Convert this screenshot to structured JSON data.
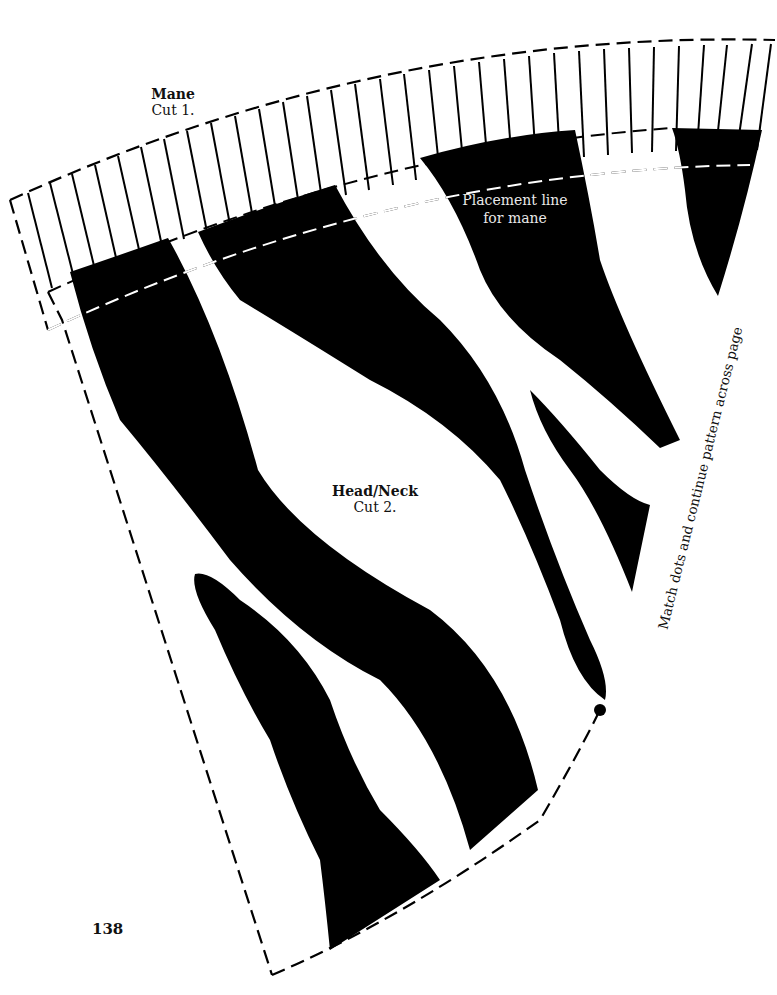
{
  "page": {
    "page_number": "138",
    "background": "#ffffff",
    "ink_color": "#000000"
  },
  "pieces": {
    "mane": {
      "name": "Mane",
      "cut": "Cut 1."
    },
    "head_neck": {
      "name": "Head/Neck",
      "cut": "Cut 2."
    }
  },
  "annotations": {
    "placement_line": "Placement line for mane",
    "placement_line_1": "Placement line",
    "placement_line_2": "for mane",
    "match_note": "Match dots and continue pattern across page"
  },
  "markers": {
    "match_dot": "match-dot"
  }
}
